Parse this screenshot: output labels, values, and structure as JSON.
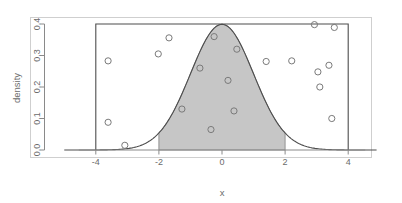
{
  "chart_data": {
    "type": "scatter",
    "title": "",
    "subtitle": "",
    "xlabel": "x",
    "ylabel": "density",
    "xlim": [
      -5.0,
      4.9
    ],
    "ylim": [
      0.0,
      0.425
    ],
    "grid": false,
    "legend": "none",
    "xticks": [
      -4,
      -2,
      0,
      2,
      4
    ],
    "xticklabels": [
      "-4",
      "-2",
      "0",
      "2",
      "4"
    ],
    "yticks": [
      0.0,
      0.1,
      0.2,
      0.3,
      0.4
    ],
    "yticklabels": [
      "0.0",
      "0.1",
      "0.2",
      "0.3",
      "0.4"
    ],
    "series": [
      {
        "name": "normal density curve",
        "type": "line",
        "color": "#4d4d4d",
        "formula": "standard normal pdf, mean 0, sd 1, peak 0.399",
        "x": [
          -5.0,
          -4.5,
          -4.0,
          -3.5,
          -3.0,
          -2.5,
          -2.0,
          -1.75,
          -1.5,
          -1.25,
          -1.0,
          -0.75,
          -0.5,
          -0.25,
          0.0,
          0.25,
          0.5,
          0.75,
          1.0,
          1.25,
          1.5,
          1.75,
          2.0,
          2.5,
          3.0,
          3.5,
          4.0,
          4.5,
          4.9
        ],
        "y": [
          1.5e-06,
          1.6e-05,
          0.0001338,
          0.0008727,
          0.0044318,
          0.0175283,
          0.053991,
          0.0862773,
          0.1295176,
          0.1826491,
          0.2419707,
          0.3011374,
          0.3520653,
          0.3866681,
          0.3989423,
          0.3866681,
          0.3520653,
          0.3011374,
          0.2419707,
          0.1826491,
          0.1295176,
          0.0862773,
          0.053991,
          0.0175283,
          0.0044318,
          0.0008727,
          0.0001338,
          1.6e-05,
          2e-06
        ]
      },
      {
        "name": "shaded region",
        "type": "area",
        "color": "#c6c6c6",
        "edge_color": "#8a8a8a",
        "x_from": -2.0,
        "x_to": 2.0
      },
      {
        "name": "bounding rectangle",
        "type": "rect",
        "color": "#4d4d4d",
        "x_from": -4.0,
        "x_to": 4.0,
        "y_from": 0.0,
        "y_to": 0.4
      },
      {
        "name": "sample points",
        "type": "scatter",
        "marker": "open-circle",
        "color": "#7a7a7a",
        "points": [
          [
            -3.61,
            0.283
          ],
          [
            -3.61,
            0.088
          ],
          [
            -3.08,
            0.015
          ],
          [
            -2.02,
            0.305
          ],
          [
            -1.68,
            0.356
          ],
          [
            -1.27,
            0.13
          ],
          [
            -0.7,
            0.26
          ],
          [
            -0.35,
            0.065
          ],
          [
            -0.25,
            0.36
          ],
          [
            0.19,
            0.221
          ],
          [
            0.38,
            0.124
          ],
          [
            0.47,
            0.32
          ],
          [
            1.4,
            0.281
          ],
          [
            2.21,
            0.283
          ],
          [
            2.93,
            0.398
          ],
          [
            3.04,
            0.248
          ],
          [
            3.1,
            0.2
          ],
          [
            3.39,
            0.269
          ],
          [
            3.48,
            0.1
          ],
          [
            3.56,
            0.389
          ]
        ]
      }
    ]
  },
  "labels": {
    "xlabel": "x",
    "ylabel": "density",
    "x_tick_m4": "-4",
    "x_tick_m2": "-2",
    "x_tick_0": "0",
    "x_tick_2": "2",
    "x_tick_4": "4",
    "y_tick_00": "0.0",
    "y_tick_01": "0.1",
    "y_tick_02": "0.2",
    "y_tick_03": "0.3",
    "y_tick_04": "0.4"
  },
  "colors": {
    "curve": "#4d4d4d",
    "shade_fill": "#c6c6c6",
    "shade_edge": "#8a8a8a",
    "rect": "#4d4d4d",
    "point": "#7a7a7a",
    "frame": "#cfcfcf",
    "axis": "#8a8a8a",
    "text": "#6b6b6b",
    "background": "#ffffff"
  }
}
